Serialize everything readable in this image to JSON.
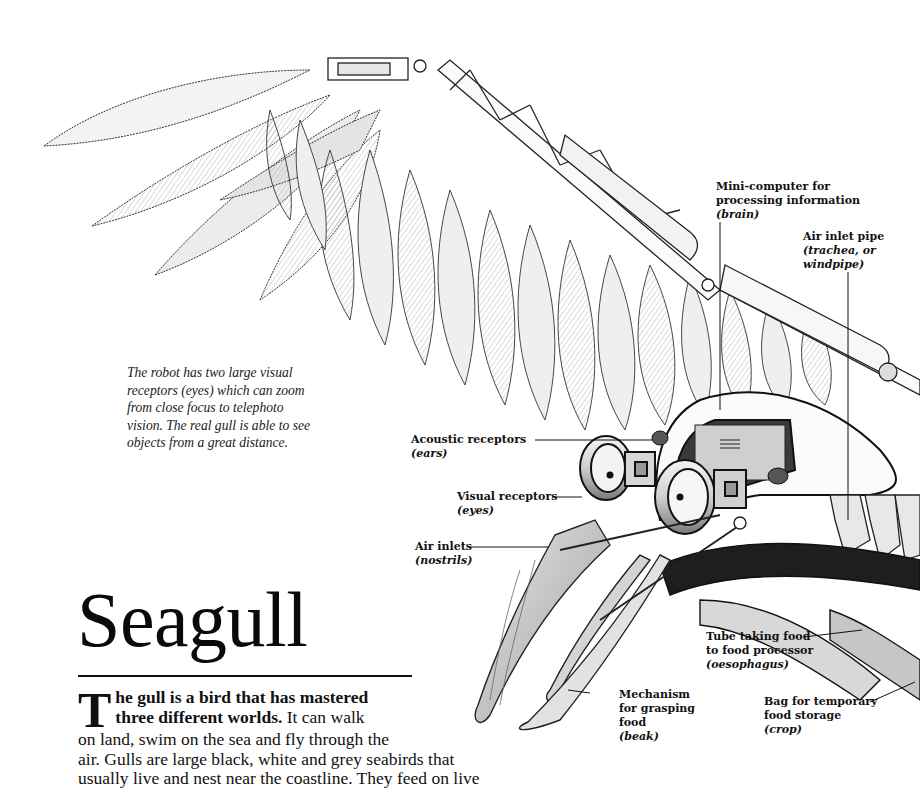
{
  "title": "Seagull",
  "caption": {
    "lines": [
      "The robot has two large visual",
      "receptors (eyes) which can zoom",
      "from close focus to telephoto",
      "vision. The real gull is able to see",
      "objects from a great distance."
    ]
  },
  "labels": {
    "brain": {
      "lines": [
        "Mini-computer for",
        "processing information"
      ],
      "sci": "(brain)"
    },
    "trachea": {
      "lines": [
        "Air inlet pipe"
      ],
      "sci": "(trachea, or",
      "sci2": "windpipe)"
    },
    "ears": {
      "lines": [
        "Acoustic receptors"
      ],
      "sci": "(ears)"
    },
    "eyes": {
      "lines": [
        "Visual receptors"
      ],
      "sci": "(eyes)"
    },
    "nostrils": {
      "lines": [
        "Air inlets"
      ],
      "sci": "(nostrils)"
    },
    "oesophagus": {
      "lines": [
        "Tube taking food",
        "to food processor"
      ],
      "sci": "(oesophagus)"
    },
    "beak": {
      "lines": [
        "Mechanism",
        "for grasping",
        "food"
      ],
      "sci": "(beak)"
    },
    "crop": {
      "lines": [
        "Bag for temporary",
        "food storage"
      ],
      "sci": "(crop)"
    }
  },
  "intro": {
    "dropcap": "T",
    "lead_line1": "he gull is a bird that has mastered",
    "lead_line2": "three different worlds.",
    "line2_rest": " It can walk",
    "lines": [
      "on land, swim on the sea and fly through the",
      "air. Gulls are large black, white and grey seabirds that",
      "usually live and nest near the coastline. They feed on live"
    ]
  },
  "colors": {
    "ink": "#111111",
    "paper": "#ffffff",
    "shade": "#8a8a8a"
  }
}
